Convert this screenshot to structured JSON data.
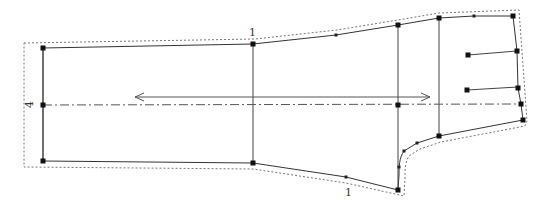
{
  "pattern": {
    "name": "sleeve-pattern-piece",
    "labels": [
      {
        "id": "top-seam-label",
        "text": "1",
        "x": 249,
        "y": 36,
        "rotate": 0
      },
      {
        "id": "bottom-seam-label",
        "text": "1",
        "x": 345,
        "y": 196,
        "rotate": 0
      },
      {
        "id": "left-edge-label",
        "text": "4",
        "x": 33,
        "y": 108,
        "rotate": -90
      }
    ],
    "outline": "M43,48 L253,44 L336,35 L398,25 L439,18 L474,16 L513,16 L517,51 L518,88 L521,104 L523,120 L439,136 L417,143 L404,151 C399,158 399,167 399,175 L398,190 L346,177 L253,163 L43,161 Z",
    "allowance": "M24,43 L255,39 L337,30 L398,20 L439,13 L519,10 L527,121 L525,126 L441,142 L420,149 L409,156 C405,162 405,170 405,178 L404,196 L346,183 L253,169 L24,167 Z",
    "seam_lines": [
      {
        "id": "seam-line-elbow",
        "x1": 253,
        "y1": 44,
        "x2": 253,
        "y2": 163
      },
      {
        "id": "seam-line-wrist",
        "x1": 398,
        "y1": 25,
        "x2": 398,
        "y2": 190
      },
      {
        "id": "seam-line-cuff",
        "x1": 439,
        "y1": 18,
        "x2": 439,
        "y2": 136
      },
      {
        "id": "dart-line-upper",
        "x1": 468,
        "y1": 55,
        "x2": 517,
        "y2": 51
      },
      {
        "id": "dart-line-lower",
        "x1": 467,
        "y1": 90,
        "x2": 518,
        "y2": 87
      },
      {
        "id": "left-edge-line",
        "x1": 43,
        "y1": 48,
        "x2": 43,
        "y2": 161
      }
    ],
    "center_line": {
      "x1": 43,
      "y1": 105,
      "x2": 521,
      "y2": 104
    },
    "grainline": {
      "x1": 135,
      "y1": 97,
      "x2": 430,
      "y2": 97
    },
    "big_points": [
      [
        43,
        48
      ],
      [
        43,
        105
      ],
      [
        43,
        161
      ],
      [
        253,
        44
      ],
      [
        253,
        163
      ],
      [
        398,
        25
      ],
      [
        398,
        105
      ],
      [
        398,
        190
      ],
      [
        439,
        18
      ],
      [
        439,
        136
      ],
      [
        513,
        16
      ],
      [
        517,
        51
      ],
      [
        518,
        88
      ],
      [
        521,
        104
      ],
      [
        523,
        120
      ],
      [
        468,
        55
      ],
      [
        467,
        90
      ]
    ],
    "small_points": [
      [
        336,
        35
      ],
      [
        474,
        16
      ],
      [
        346,
        177
      ],
      [
        399,
        167
      ],
      [
        404,
        151
      ],
      [
        417,
        143
      ]
    ]
  }
}
